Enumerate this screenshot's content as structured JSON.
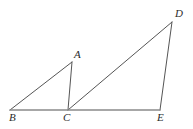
{
  "figure": {
    "name": "two-triangles-shared-baseline",
    "background_color": "#ffffff",
    "stroke_color": "#555555",
    "baseline_color": "#8a8a8a",
    "label_color": "#2b2b2b",
    "width": 193,
    "height": 129,
    "vertices": [
      {
        "id": "A",
        "label": "A",
        "x": 72,
        "y": 62,
        "label_x": 74,
        "label_y": 49
      },
      {
        "id": "B",
        "label": "B",
        "x": 10,
        "y": 110,
        "label_x": 9,
        "label_y": 112
      },
      {
        "id": "C",
        "label": "C",
        "x": 68,
        "y": 110,
        "label_x": 63,
        "label_y": 112
      },
      {
        "id": "D",
        "label": "D",
        "x": 172,
        "y": 22,
        "label_x": 175,
        "label_y": 8
      },
      {
        "id": "E",
        "label": "E",
        "x": 160,
        "y": 110,
        "label_x": 157,
        "label_y": 112
      }
    ],
    "segments": [
      {
        "id": "BA",
        "from": "B",
        "to": "A",
        "x1": 10,
        "y1": 110,
        "x2": 72,
        "y2": 62,
        "width": 1.0,
        "color": "#555555"
      },
      {
        "id": "AC",
        "from": "A",
        "to": "C",
        "x1": 72,
        "y1": 62,
        "x2": 68,
        "y2": 110,
        "width": 1.0,
        "color": "#555555"
      },
      {
        "id": "CD",
        "from": "C",
        "to": "D",
        "x1": 68,
        "y1": 110,
        "x2": 172,
        "y2": 22,
        "width": 1.0,
        "color": "#555555"
      },
      {
        "id": "DE",
        "from": "D",
        "to": "E",
        "x1": 172,
        "y1": 22,
        "x2": 160,
        "y2": 110,
        "width": 1.0,
        "color": "#555555"
      },
      {
        "id": "BE",
        "from": "B",
        "to": "E",
        "x1": 10,
        "y1": 110,
        "x2": 160,
        "y2": 110,
        "width": 1.6,
        "color": "#8a8a8a"
      }
    ]
  }
}
